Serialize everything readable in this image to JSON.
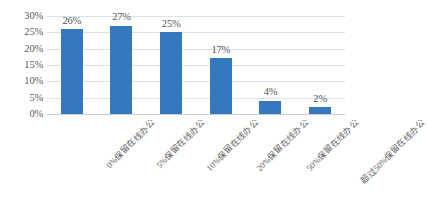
{
  "chart_data": {
    "type": "bar",
    "title": "",
    "subtitle": "",
    "xlabel": "",
    "ylabel": "",
    "ylim": [
      0,
      30
    ],
    "ytick_labels": [
      "30%",
      "25%",
      "20%",
      "15%",
      "10%",
      "5%",
      "0%"
    ],
    "ytick_values": [
      30,
      25,
      20,
      15,
      10,
      5,
      0
    ],
    "grid": true,
    "legend": false,
    "legend_position": "none",
    "value_label_suffix": "%",
    "categories": [
      "0%保留在线办公",
      "5%保留在线办公",
      "10%保留在线办公",
      "20%保留在线办公",
      "50%保留在线办公",
      "超过50%保留在线办公"
    ],
    "values": [
      26,
      27,
      25,
      17,
      4,
      2
    ],
    "value_labels": [
      "26%",
      "27%",
      "25%",
      "17%",
      "4%",
      "2%"
    ],
    "colors": {
      "bar": "#3478be",
      "gridline": "#d6e3ef",
      "axis_line": "#c3cfdb",
      "text": "#595959",
      "background": "#ffffff"
    }
  }
}
